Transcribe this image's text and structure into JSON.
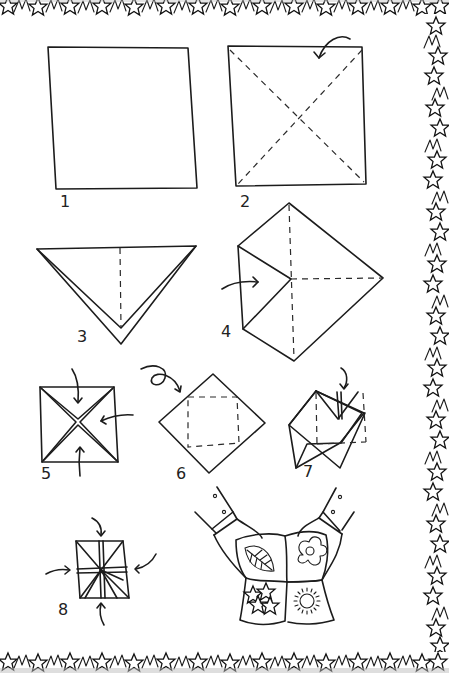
{
  "diagram": {
    "type": "origami-instructions",
    "border": {
      "style": "hand-drawn star pattern",
      "sides": [
        "top",
        "right",
        "bottom"
      ],
      "color": "#1c1c1c"
    },
    "steps": [
      {
        "number": "1",
        "description": "Start with a square sheet of paper"
      },
      {
        "number": "2",
        "description": "Fold along both diagonals (dashed lines), arrow shows corner fold"
      },
      {
        "number": "3",
        "description": "Triangle folded along diagonal, center crease dashed"
      },
      {
        "number": "4",
        "description": "Fold corners into center (arrow pointing to center)"
      },
      {
        "number": "5",
        "description": "Square with all four corners folded to center, arrows from three sides"
      },
      {
        "number": "6",
        "description": "Turn over, diamond with dashed inner square, looped arrow"
      },
      {
        "number": "7",
        "description": "Fold corners to center on this side, arrow pointing down"
      },
      {
        "number": "8",
        "description": "Push sides in, arrows from four sides"
      }
    ],
    "final": {
      "description": "Finished fortune teller held by two hands",
      "panels": [
        "leaf",
        "flower",
        "stars",
        "sun"
      ]
    }
  }
}
